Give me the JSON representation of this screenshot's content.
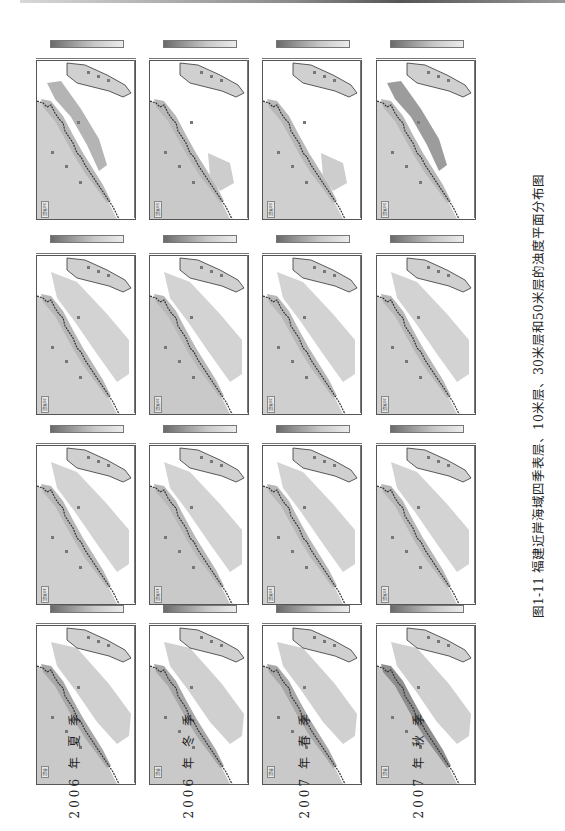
{
  "figure": {
    "caption": "图1-11  福建近岸海域四季表层、10米层、30米层和50米层的浊度平面分布图",
    "figure_number": "图1-11",
    "title": "福建近岸海域四季表层、10米层、30米层和50米层的浊度平面分布图",
    "orientation": "rotated-90"
  },
  "seasons": [
    {
      "label": "2006 年 夏 季",
      "year": "2006",
      "season": "年夏季"
    },
    {
      "label": "2006 年 冬 季",
      "year": "2006",
      "season": "年冬季"
    },
    {
      "label": "2007 年 春 季",
      "year": "2007",
      "season": "年春季"
    },
    {
      "label": "2007 年 秋 季",
      "year": "2007",
      "season": "年秋季"
    }
  ],
  "layers": [
    {
      "label": "表层"
    },
    {
      "label": "10米层"
    },
    {
      "label": "30米层"
    },
    {
      "label": "50米层"
    }
  ],
  "legend": {
    "colormap": [
      "#6a6a6a",
      "#9a9a9a",
      "#c8c8c8",
      "#ececec"
    ],
    "description": "浊度 grayscale color bar (dark = high, light = low)"
  },
  "colors": {
    "sea_fill": "#cfcfcf",
    "high_turbidity": "#8a8a8a",
    "land": "#ffffff",
    "border": "#555555"
  }
}
